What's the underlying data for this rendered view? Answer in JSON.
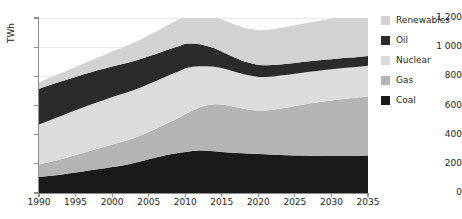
{
  "title": "Scenario",
  "legend": {
    "position": "right",
    "items": [
      {
        "label": "Renewables",
        "color": "#d2d2d2"
      },
      {
        "label": "Oil",
        "color": "#2b2b2b"
      },
      {
        "label": "Nuclear",
        "color": "#dcdcdc"
      },
      {
        "label": "Gas",
        "color": "#b4b4b4"
      },
      {
        "label": "Coal",
        "color": "#1a1a1a"
      }
    ]
  },
  "axes": {
    "y_label": "TWh",
    "y_ticks": [
      "0",
      "200",
      "400",
      "600",
      "800",
      "1 000",
      "1 200"
    ],
    "x_ticks": [
      "1990",
      "1995",
      "2000",
      "2005",
      "2010",
      "2015",
      "2020",
      "2025",
      "2030",
      "2035"
    ]
  },
  "chart_data": {
    "type": "area",
    "title": "Scenario",
    "xlabel": "",
    "ylabel": "TWh",
    "ylim": [
      0,
      1200
    ],
    "xlim": [
      1990,
      2035
    ],
    "grid": true,
    "stacked": true,
    "legend_position": "right",
    "x": [
      1990,
      1991,
      1992,
      1993,
      1994,
      1995,
      1996,
      1997,
      1998,
      1999,
      2000,
      2001,
      2002,
      2003,
      2004,
      2005,
      2006,
      2007,
      2008,
      2009,
      2010,
      2011,
      2012,
      2013,
      2014,
      2015,
      2016,
      2017,
      2018,
      2019,
      2020,
      2021,
      2022,
      2023,
      2024,
      2025,
      2026,
      2027,
      2028,
      2029,
      2030,
      2031,
      2032,
      2033,
      2034,
      2035
    ],
    "series": [
      {
        "name": "Coal",
        "color": "#1a1a1a",
        "values": [
          110,
          115,
          120,
          126,
          133,
          140,
          148,
          156,
          163,
          170,
          178,
          186,
          194,
          205,
          218,
          232,
          244,
          256,
          266,
          274,
          282,
          288,
          292,
          290,
          286,
          281,
          277,
          274,
          272,
          270,
          268,
          266,
          263,
          261,
          259,
          258,
          257,
          256,
          255,
          254,
          253,
          253,
          253,
          254,
          255,
          257
        ]
      },
      {
        "name": "Gas",
        "color": "#b4b4b4",
        "values": [
          85,
          92,
          99,
          106,
          113,
          120,
          127,
          133,
          140,
          147,
          154,
          160,
          166,
          172,
          178,
          186,
          196,
          208,
          222,
          238,
          258,
          278,
          296,
          312,
          322,
          326,
          322,
          314,
          306,
          300,
          296,
          300,
          308,
          318,
          328,
          338,
          348,
          358,
          366,
          374,
          382,
          388,
          394,
          398,
          402,
          406
        ]
      },
      {
        "name": "Nuclear",
        "color": "#dcdcdc",
        "values": [
          275,
          282,
          290,
          296,
          302,
          308,
          312,
          316,
          320,
          323,
          326,
          328,
          330,
          330,
          330,
          329,
          328,
          326,
          324,
          320,
          316,
          300,
          282,
          268,
          258,
          250,
          244,
          240,
          236,
          234,
          232,
          230,
          228,
          226,
          224,
          222,
          220,
          218,
          216,
          215,
          214,
          213,
          212,
          211,
          210,
          210
        ]
      },
      {
        "name": "Oil",
        "color": "#2b2b2b",
        "values": [
          245,
          243,
          240,
          236,
          232,
          228,
          225,
          222,
          218,
          214,
          210,
          206,
          202,
          198,
          194,
          190,
          186,
          182,
          178,
          172,
          168,
          160,
          150,
          138,
          126,
          114,
          104,
          96,
          90,
          86,
          82,
          80,
          78,
          76,
          75,
          74,
          73,
          72,
          71,
          70,
          69,
          68,
          68,
          67,
          67,
          66
        ]
      },
      {
        "name": "Renewables",
        "color": "#d2d2d2",
        "values": [
          45,
          48,
          52,
          57,
          62,
          68,
          74,
          80,
          87,
          94,
          102,
          110,
          118,
          126,
          134,
          143,
          152,
          162,
          172,
          182,
          192,
          200,
          206,
          210,
          214,
          218,
          222,
          226,
          230,
          234,
          238,
          242,
          246,
          250,
          254,
          258,
          262,
          266,
          270,
          274,
          278,
          282,
          286,
          290,
          294,
          298
        ]
      }
    ],
    "totals": [
      760,
      780,
      801,
      821,
      842,
      864,
      886,
      907,
      928,
      948,
      970,
      990,
      1010,
      1031,
      1054,
      1080,
      1106,
      1134,
      1162,
      1186,
      1216,
      1226,
      1226,
      1218,
      1206,
      1189,
      1169,
      1150,
      1134,
      1124,
      1116,
      1118,
      1123,
      1131,
      1140,
      1150,
      1160,
      1170,
      1178,
      1187,
      1196,
      1204,
      1213,
      1220,
      1228,
      1237
    ]
  }
}
